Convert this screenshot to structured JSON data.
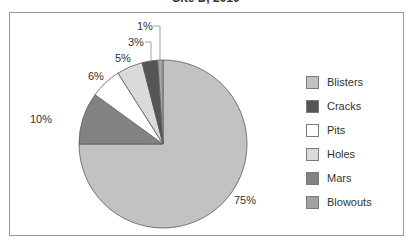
{
  "chart_data": {
    "type": "pie",
    "title": "Site D, 2010",
    "start_angle_deg": 0,
    "direction": "clockwise",
    "slices": [
      {
        "label": "Blisters",
        "value": 75,
        "display": "75%",
        "color": "#c2c2c2"
      },
      {
        "label": "Mars",
        "value": 10,
        "display": "10%",
        "color": "#828282"
      },
      {
        "label": "Pits",
        "value": 6,
        "display": "6%",
        "color": "#ffffff"
      },
      {
        "label": "Holes",
        "value": 5,
        "display": "5%",
        "color": "#dadada"
      },
      {
        "label": "Cracks",
        "value": 3,
        "display": "3%",
        "color": "#555555"
      },
      {
        "label": "Blowouts",
        "value": 1,
        "display": "1%",
        "color": "#a3a3a3"
      }
    ],
    "legend": {
      "position": "right",
      "entries": [
        {
          "label": "Blisters",
          "color": "#c2c2c2"
        },
        {
          "label": "Cracks",
          "color": "#555555"
        },
        {
          "label": "Pits",
          "color": "#ffffff"
        },
        {
          "label": "Holes",
          "color": "#dadada"
        },
        {
          "label": "Mars",
          "color": "#828282"
        },
        {
          "label": "Blowouts",
          "color": "#a3a3a3"
        }
      ]
    }
  },
  "labels": {
    "blisters": "75%",
    "mars": "10%",
    "pits": "6%",
    "holes": "5%",
    "cracks": "3%",
    "blowouts": "1%"
  }
}
